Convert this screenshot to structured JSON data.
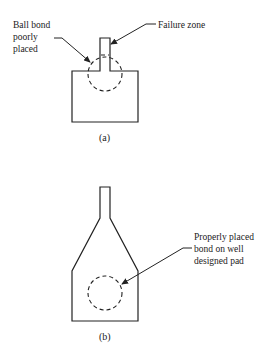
{
  "figure_a": {
    "caption": "(a)",
    "label_left": [
      "Ball bond",
      "poorly",
      "placed"
    ],
    "label_right": "Failure zone"
  },
  "figure_b": {
    "caption": "(b)",
    "label_right": [
      "Properly placed",
      "bond on well",
      "designed pad"
    ]
  },
  "colors": {
    "line": "#222222",
    "background": "#ffffff"
  }
}
